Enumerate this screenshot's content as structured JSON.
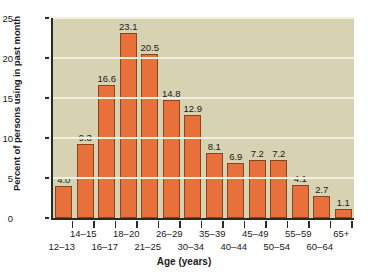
{
  "chart_data": {
    "type": "bar",
    "title": "",
    "xlabel": "Age (years)",
    "ylabel": "Percent of persons using in past month",
    "ylim": [
      0,
      25
    ],
    "yticks": [
      0,
      5,
      10,
      15,
      20,
      25
    ],
    "grid": true,
    "legend": null,
    "categories": [
      "12–13",
      "14–15",
      "16–17",
      "18–20",
      "21–25",
      "26–29",
      "30–34",
      "35–39",
      "40–44",
      "45–49",
      "50–54",
      "55–59",
      "60–64",
      "65+"
    ],
    "values": [
      4.0,
      9.3,
      16.6,
      23.1,
      20.5,
      14.8,
      12.9,
      8.1,
      6.9,
      7.2,
      7.2,
      4.1,
      2.7,
      1.1
    ],
    "data_labels": [
      "4.0",
      "9.3",
      "16.6",
      "23.1",
      "20.5",
      "14.8",
      "12.9",
      "8.1",
      "6.9",
      "7.2",
      "7.2",
      "4.1",
      "2.7",
      "1.1"
    ],
    "tick_label_rows": {
      "top": [
        "14–15",
        "18–20",
        "26–29",
        "35–39",
        "45–49",
        "55–59",
        "65+"
      ],
      "bottom": [
        "12–13",
        "16–17",
        "21–25",
        "30–34",
        "40–44",
        "50–54",
        "60–64"
      ]
    },
    "colors": {
      "bar_fill": "#e8703a",
      "bar_stroke": "#8a4420",
      "plot_background": "#d6d2b2",
      "gridline": "#f2f0e2",
      "axis": "#2a2a26",
      "page_background": "#ffffff",
      "text": "#1a1a1a"
    }
  }
}
